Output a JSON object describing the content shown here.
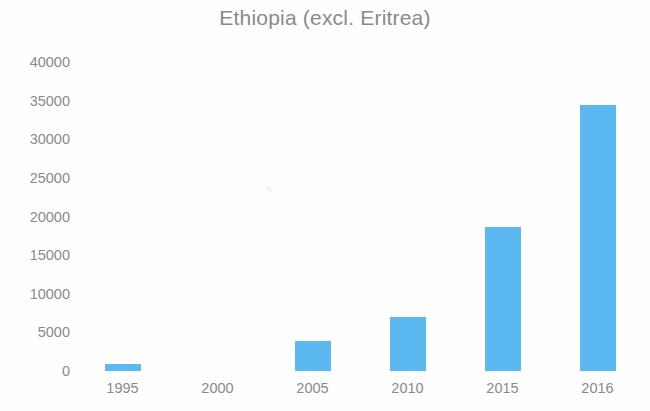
{
  "chart_data": {
    "type": "bar",
    "title": "Ethiopia (excl. Eritrea)",
    "subtitle": "",
    "xlabel": "",
    "ylabel": "",
    "categories": [
      "1995",
      "2000",
      "2005",
      "2010",
      "2015",
      "2016"
    ],
    "values": [
      900,
      0,
      3900,
      7000,
      18700,
      34400
    ],
    "series": [
      {
        "name": "Ethiopia (excl. Eritrea)",
        "values": [
          900,
          0,
          3900,
          7000,
          18700,
          34400
        ]
      }
    ],
    "ylim": [
      0,
      40000
    ],
    "ytick_labels": [
      "40000",
      "35000",
      "30000",
      "25000",
      "20000",
      "15000",
      "10000",
      "5000",
      "0"
    ],
    "ytick_values": [
      40000,
      35000,
      30000,
      25000,
      20000,
      15000,
      10000,
      5000,
      0
    ],
    "xtick_labels": [
      "1995",
      "2000",
      "2005",
      "2010",
      "2015",
      "2016"
    ],
    "grid": false,
    "legend": false,
    "legend_position": "none",
    "bar_color": "#5bb8f0",
    "text_color": "#8a8a8a",
    "background_color": "#ffffff",
    "annotations": []
  }
}
